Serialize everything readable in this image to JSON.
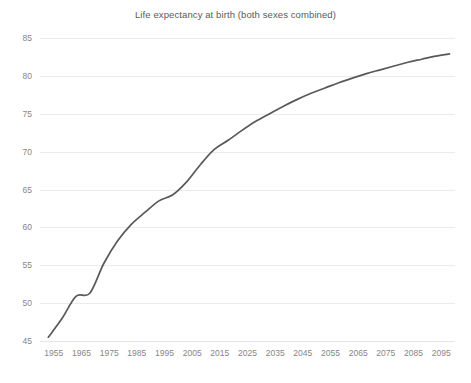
{
  "chart_data": {
    "type": "line",
    "title": "Life expectancy at birth (both sexes combined)",
    "xlabel": "",
    "ylabel": "",
    "grid": "horizontal",
    "legend_position": "none",
    "line_color": "#595959",
    "grid_color": "#eceaea",
    "axis_label_color": "#868686",
    "xlim": [
      1950,
      2100
    ],
    "ylim": [
      45,
      85
    ],
    "ytick_step": 5,
    "xtick_step": 10,
    "ytick_labels": [
      "85",
      "80",
      "75",
      "70",
      "65",
      "60",
      "55",
      "50",
      "45"
    ],
    "yticks": [
      85,
      80,
      75,
      70,
      65,
      60,
      55,
      50,
      45
    ],
    "xtick_labels": [
      "1955",
      "1965",
      "1975",
      "1985",
      "1995",
      "2005",
      "2015",
      "2025",
      "2035",
      "2045",
      "2055",
      "2065",
      "2075",
      "2085",
      "2095"
    ],
    "xticks": [
      1955,
      1965,
      1975,
      1985,
      1995,
      2005,
      2015,
      2025,
      2035,
      2045,
      2055,
      2065,
      2075,
      2085,
      2095
    ],
    "x": [
      1953,
      1958,
      1963,
      1968,
      1973,
      1978,
      1983,
      1988,
      1993,
      1998,
      2003,
      2008,
      2013,
      2018,
      2023,
      2028,
      2033,
      2038,
      2043,
      2048,
      2053,
      2058,
      2063,
      2068,
      2073,
      2078,
      2083,
      2088,
      2093,
      2098
    ],
    "values": [
      45.5,
      48.0,
      50.9,
      51.3,
      55.2,
      58.2,
      60.4,
      62.0,
      63.5,
      64.3,
      66.0,
      68.3,
      70.3,
      71.5,
      72.8,
      74.0,
      75.0,
      76.0,
      76.9,
      77.7,
      78.4,
      79.1,
      79.7,
      80.3,
      80.8,
      81.3,
      81.8,
      82.2,
      82.6,
      82.9
    ],
    "series": [
      {
        "name": "Life expectancy at birth (both sexes combined)",
        "values": [
          45.5,
          48.0,
          50.9,
          51.3,
          55.2,
          58.2,
          60.4,
          62.0,
          63.5,
          64.3,
          66.0,
          68.3,
          70.3,
          71.5,
          72.8,
          74.0,
          75.0,
          76.0,
          76.9,
          77.7,
          78.4,
          79.1,
          79.7,
          80.3,
          80.8,
          81.3,
          81.8,
          82.2,
          82.6,
          82.9
        ]
      }
    ]
  }
}
